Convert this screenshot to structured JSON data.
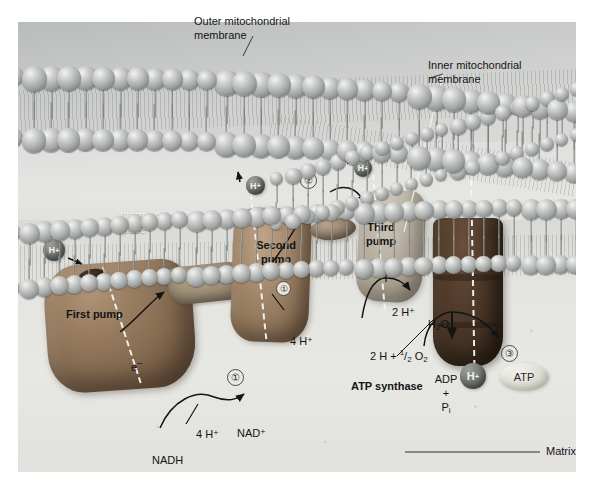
{
  "figure": {
    "width": 599,
    "height": 494
  },
  "callouts": {
    "outer_membrane": "Outer mitochondrial\nmembrane",
    "inner_membrane": "Inner mitochondrial\nmembrane",
    "matrix": "Matrix",
    "intermembrane_space": "Intermembrane\nspace"
  },
  "proteins": {
    "first_pump": "First pump",
    "second_pump": "Second\npump",
    "third_pump": "Third\npump",
    "atp_synthase": "ATP synthase"
  },
  "molecules": {
    "electron": "e–",
    "nadh": "NADH",
    "nad_plus": "NAD⁺",
    "four_h_left": "4 H⁺",
    "four_h_mid": "4 H⁺",
    "two_h_water": "2 H⁺",
    "water": "H2O",
    "water_sub": "2",
    "oxygen_reactant_pre": "2 H + ",
    "oxygen_frac_num": "1",
    "oxygen_frac_den": "2",
    "oxygen_symbol": "O",
    "oxygen_sub": "2",
    "adp": "ADP",
    "plus": "+",
    "phosphate": "P",
    "phosphate_sub": "i",
    "atp": "ATP",
    "proton": "H",
    "proton_charge": "+"
  },
  "protons": [
    {
      "id": "h-ims-left",
      "label": "H",
      "charge": "+",
      "x": 43,
      "y": 228,
      "size": 22
    },
    {
      "id": "h-pump2-top",
      "label": "H",
      "charge": "+",
      "x": 237,
      "y": 163,
      "size": 19
    },
    {
      "id": "h-pump3-top",
      "label": "H",
      "charge": "+",
      "x": 345,
      "y": 146,
      "size": 18
    },
    {
      "id": "h-matrix-synthase",
      "label": "H",
      "charge": "+",
      "x": 466,
      "y": 366,
      "size": 24
    }
  ],
  "step_markers": [
    {
      "id": "step-1-matrix",
      "label": "①",
      "x": 216,
      "y": 354
    },
    {
      "id": "step-1-pump2",
      "label": "①",
      "x": 265,
      "y": 266
    },
    {
      "id": "step-2-ims",
      "label": "②",
      "x": 289,
      "y": 157
    },
    {
      "id": "step-3-matrix",
      "label": "③",
      "x": 490,
      "y": 330
    }
  ],
  "colors": {
    "background": "#ffffff",
    "membrane_bead": "#9ea2a0",
    "pump_brown": "#8f755a",
    "pump_dark_brown": "#846a50",
    "synthase_dark": "#453325",
    "proton_gray": "#636662",
    "atp_pale": "#e1e0d8",
    "text": "#141414",
    "dash_white": "#f6f6f4"
  }
}
